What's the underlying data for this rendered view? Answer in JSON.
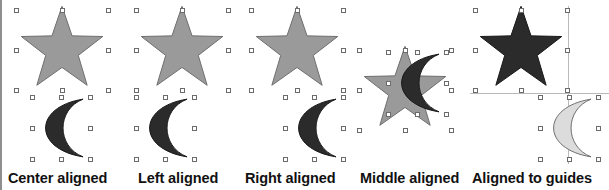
{
  "figure": {
    "background_color": "#ffffff",
    "left_rule_color": "#8f8f8f",
    "caption_color": "#111111",
    "handle_fill": "#ffffff",
    "handle_stroke": "#6b6b6b",
    "guide_color": "#b9b9b9"
  },
  "panels": [
    {
      "id": "center-aligned",
      "caption": "Center aligned",
      "caption_left": 8,
      "left": 0,
      "width": 128,
      "shapes": [
        {
          "kind": "star",
          "fill": "#9a9a9a",
          "stroke": "#6f6f6f",
          "x": 16,
          "y": 10,
          "w": 92,
          "h": 80,
          "handles": true
        },
        {
          "kind": "moon",
          "fill": "#2b2b2b",
          "stroke": "#1a1a1a",
          "x": 32,
          "y": 97,
          "w": 58,
          "h": 62,
          "handles": true
        }
      ],
      "guides": []
    },
    {
      "id": "left-aligned",
      "caption": "Left aligned",
      "caption_left": 138,
      "left": 128,
      "width": 110,
      "shapes": [
        {
          "kind": "star",
          "fill": "#9a9a9a",
          "stroke": "#6f6f6f",
          "x": 8,
          "y": 10,
          "w": 92,
          "h": 80,
          "handles": true
        },
        {
          "kind": "moon",
          "fill": "#2b2b2b",
          "stroke": "#1a1a1a",
          "x": 8,
          "y": 97,
          "w": 58,
          "h": 62,
          "handles": true
        }
      ],
      "guides": []
    },
    {
      "id": "right-aligned",
      "caption": "Right aligned",
      "caption_left": 245,
      "left": 238,
      "width": 112,
      "shapes": [
        {
          "kind": "star",
          "fill": "#9a9a9a",
          "stroke": "#6f6f6f",
          "x": 13,
          "y": 10,
          "w": 92,
          "h": 80,
          "handles": true
        },
        {
          "kind": "moon",
          "fill": "#2b2b2b",
          "stroke": "#1a1a1a",
          "x": 47,
          "y": 97,
          "w": 58,
          "h": 62,
          "handles": true
        }
      ],
      "guides": []
    },
    {
      "id": "middle-aligned",
      "caption": "Middle aligned",
      "caption_left": 360,
      "left": 350,
      "width": 108,
      "shapes": [
        {
          "kind": "star",
          "fill": "#9a9a9a",
          "stroke": "#6f6f6f",
          "x": 9,
          "y": 50,
          "w": 92,
          "h": 80,
          "handles": true
        },
        {
          "kind": "moon",
          "fill": "#2b2b2b",
          "stroke": "#1a1a1a",
          "x": 38,
          "y": 52,
          "w": 58,
          "h": 62,
          "handles": true
        }
      ],
      "guides": []
    },
    {
      "id": "aligned-to-guides",
      "caption": "Aligned to guides",
      "caption_left": 472,
      "left": 458,
      "width": 151,
      "shapes": [
        {
          "kind": "star",
          "fill": "#2b2b2b",
          "stroke": "#1a1a1a",
          "x": 17,
          "y": 10,
          "w": 92,
          "h": 80,
          "handles": true
        },
        {
          "kind": "moon",
          "fill": "#dcdcdc",
          "stroke": "#6f6f6f",
          "x": 82,
          "y": 97,
          "w": 58,
          "h": 62,
          "handles": true
        }
      ],
      "guides": [
        {
          "orientation": "horizontal",
          "x": 12,
          "y": 93,
          "length": 139
        },
        {
          "orientation": "vertical",
          "x": 110,
          "y": 6,
          "length": 158
        }
      ]
    }
  ]
}
